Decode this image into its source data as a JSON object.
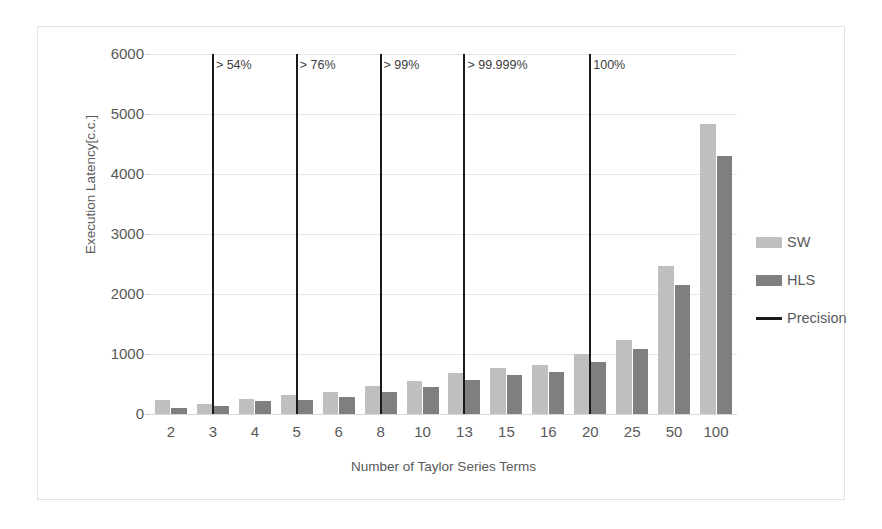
{
  "chart_data": {
    "type": "bar",
    "title": "",
    "xlabel": "Number of Taylor Series Terms",
    "ylabel": "Execution Latency[c.c.]",
    "categories": [
      "2",
      "3",
      "4",
      "5",
      "6",
      "8",
      "10",
      "13",
      "15",
      "16",
      "20",
      "25",
      "50",
      "100"
    ],
    "series": [
      {
        "name": "SW",
        "color": "#bfbfbf",
        "values": [
          230,
          170,
          250,
          320,
          360,
          460,
          550,
          690,
          760,
          810,
          1000,
          1230,
          2470,
          4830
        ]
      },
      {
        "name": "HLS",
        "color": "#7f7f7f",
        "values": [
          100,
          140,
          210,
          230,
          280,
          370,
          450,
          570,
          650,
          700,
          860,
          1080,
          2150,
          4300
        ]
      }
    ],
    "ylim": [
      0,
      6000
    ],
    "yticks": [
      0,
      1000,
      2000,
      3000,
      4000,
      5000,
      6000
    ],
    "ytick_labels": [
      "0",
      "1000",
      "2000",
      "3000",
      "4000",
      "5000",
      "6000"
    ],
    "grid": true,
    "legend_position": "right",
    "annotations": [
      {
        "category": "3",
        "label": "> 54%",
        "type": "precision-line",
        "color": "#1a1a1a"
      },
      {
        "category": "5",
        "label": "> 76%",
        "type": "precision-line",
        "color": "#1a1a1a"
      },
      {
        "category": "8",
        "label": "> 99%",
        "type": "precision-line",
        "color": "#1a1a1a"
      },
      {
        "category": "13",
        "label": "> 99.999%",
        "type": "precision-line",
        "color": "#1a1a1a"
      },
      {
        "category": "20",
        "label": "100%",
        "type": "precision-line",
        "color": "#1a1a1a"
      }
    ],
    "legend": [
      {
        "label": "SW",
        "swatch": "sw"
      },
      {
        "label": "HLS",
        "swatch": "hls"
      },
      {
        "label": "Precision",
        "swatch": "line"
      }
    ]
  }
}
